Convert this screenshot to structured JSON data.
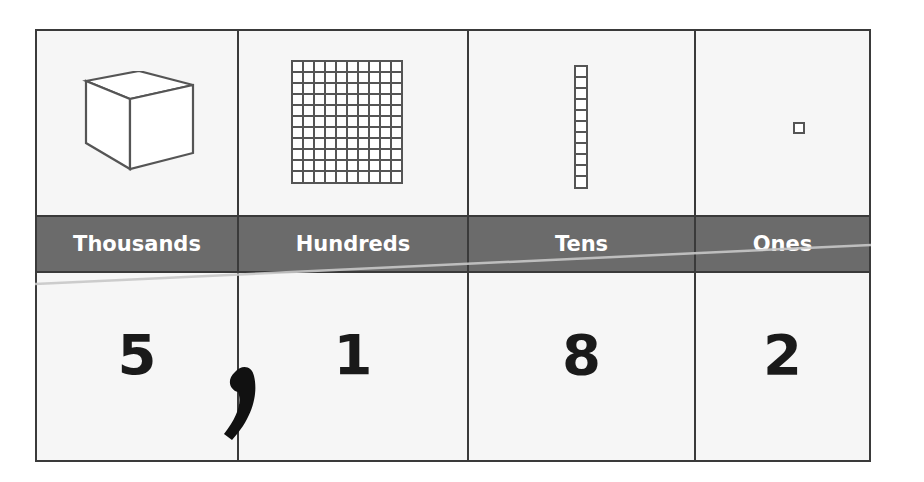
{
  "columns": [
    {
      "label": "Thousands",
      "block": "cube",
      "digit": "5"
    },
    {
      "label": "Hundreds",
      "block": "flat",
      "digit": "1"
    },
    {
      "label": "Tens",
      "block": "rod",
      "digit": "8"
    },
    {
      "label": "Ones",
      "block": "unit",
      "digit": "2"
    }
  ],
  "separator": ",",
  "number": "5,182",
  "colors": {
    "band": "#6b6b6b",
    "border": "#3a3a3a",
    "cell_bg": "#f6f6f6",
    "digit": "#1a1a1a",
    "band_text": "#ffffff"
  }
}
